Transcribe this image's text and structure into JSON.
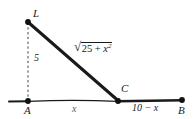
{
  "figure": {
    "type": "geometry-diagram",
    "background_color": "#ffffff",
    "line_color": "#1a1a1a",
    "points": [
      {
        "id": "L",
        "label": "L",
        "x": 28,
        "y": 22
      },
      {
        "id": "A",
        "label": "A",
        "x": 28,
        "y": 101
      },
      {
        "id": "C",
        "label": "C",
        "x": 118,
        "y": 101
      },
      {
        "id": "B",
        "label": "B",
        "x": 182,
        "y": 100
      }
    ],
    "edges": [
      {
        "from": "L",
        "to": "A",
        "style": "dashed",
        "label": "5"
      },
      {
        "from": "L",
        "to": "C",
        "style": "solid-thick",
        "label": "sqrt(25 + x^2)"
      },
      {
        "from": "A",
        "to": "C",
        "style": "solid-thin",
        "label": "x"
      },
      {
        "from": "C",
        "to": "B",
        "style": "solid-thick",
        "label": "10 - x"
      }
    ],
    "labels": {
      "point_L": "L",
      "point_A": "A",
      "point_C": "C",
      "point_B": "B",
      "height": "5",
      "segment_AC": "x",
      "segment_CB": "10 − x",
      "hypotenuse_radicand_a": "25 + ",
      "hypotenuse_radicand_x": "x",
      "hypotenuse_radicand_exp": "2",
      "radical_sign": "√"
    }
  }
}
